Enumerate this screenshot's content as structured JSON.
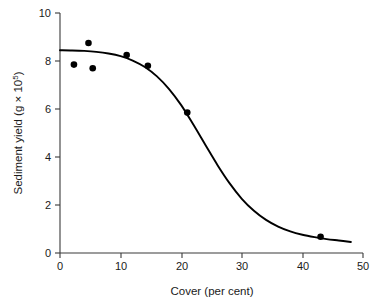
{
  "chart_data": {
    "type": "scatter",
    "title": "",
    "xlabel": "Cover (per cent)",
    "ylabel": "Sediment yield (g × 10⁵)",
    "ylabel_base": "Sediment yield (g × 10",
    "ylabel_exponent": "5",
    "ylabel_close": ")",
    "xlim": [
      0,
      50
    ],
    "ylim": [
      0,
      10
    ],
    "xticks": [
      0,
      10,
      20,
      30,
      40,
      50
    ],
    "yticks": [
      0,
      2,
      4,
      6,
      8,
      10
    ],
    "xtick_labels": [
      "0",
      "10",
      "20",
      "30",
      "40",
      "50"
    ],
    "ytick_labels": [
      "0",
      "2",
      "4",
      "6",
      "8",
      "10"
    ],
    "grid": false,
    "legend": false,
    "marker_color": "#000000",
    "line_color": "#000000",
    "axis_color": "#3a3a3a",
    "background": "#ffffff",
    "points": [
      {
        "x": 2.3,
        "y": 7.85
      },
      {
        "x": 4.7,
        "y": 8.75
      },
      {
        "x": 5.4,
        "y": 7.7
      },
      {
        "x": 11.0,
        "y": 8.25
      },
      {
        "x": 14.5,
        "y": 7.8
      },
      {
        "x": 21.0,
        "y": 5.85
      },
      {
        "x": 43.0,
        "y": 0.68
      }
    ],
    "series": [
      {
        "name": "fitted logistic curve",
        "x": [
          0,
          2,
          4,
          6,
          8,
          10,
          12,
          14,
          16,
          18,
          20,
          22,
          24,
          26,
          28,
          30,
          32,
          34,
          36,
          38,
          40,
          42,
          44,
          46,
          48
        ],
        "values": [
          8.45,
          8.44,
          8.42,
          8.38,
          8.31,
          8.2,
          8.02,
          7.75,
          7.36,
          6.83,
          6.16,
          5.35,
          4.5,
          3.66,
          2.9,
          2.26,
          1.76,
          1.38,
          1.1,
          0.9,
          0.76,
          0.66,
          0.58,
          0.52,
          0.46
        ]
      }
    ],
    "annotations": []
  },
  "figure": {
    "caption": ""
  }
}
